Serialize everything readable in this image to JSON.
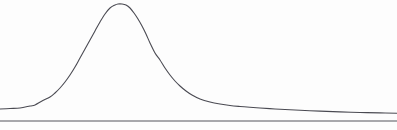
{
  "figure": {
    "title": "",
    "background_color": "#fdfdfd",
    "width": 397,
    "height": 130
  },
  "style": {
    "curve_color": "#4a4a52",
    "curve_width": 1.1,
    "baseline_color": "#55555d",
    "baseline_width": 1.1
  },
  "chart_data": {
    "type": "line",
    "title": "",
    "xlabel": "",
    "ylabel": "",
    "grid": false,
    "legend": null,
    "axis_visible": false,
    "xlim": [
      0,
      397
    ],
    "ylim": [
      0,
      130
    ],
    "series": [
      {
        "name": "density-curve",
        "color": "#4a4a52",
        "x": [
          0,
          10,
          20,
          30,
          35,
          42,
          50,
          55,
          60,
          65,
          70,
          75,
          80,
          85,
          90,
          95,
          100,
          105,
          110,
          115,
          118,
          122,
          126,
          130,
          134,
          138,
          142,
          146,
          150,
          155,
          160,
          165,
          170,
          175,
          180,
          186,
          192,
          200,
          210,
          220,
          230,
          240,
          250,
          260,
          275,
          290,
          305,
          320,
          340,
          360,
          380,
          397
        ],
        "y": [
          109,
          108.5,
          108,
          106,
          105,
          101,
          97,
          93,
          88,
          82,
          75,
          67,
          58,
          49,
          40,
          31,
          22,
          14,
          8,
          5,
          4,
          4,
          5,
          8,
          13,
          19,
          26,
          34,
          43,
          53,
          60,
          68,
          75,
          81,
          86,
          91,
          95,
          99,
          102,
          104,
          105.5,
          106.5,
          107.3,
          108,
          109,
          109.8,
          110.5,
          111.1,
          111.9,
          112.5,
          112.9,
          113.2
        ]
      },
      {
        "name": "baseline",
        "color": "#55555d",
        "x": [
          0,
          397
        ],
        "y": [
          121,
          121
        ]
      }
    ]
  }
}
